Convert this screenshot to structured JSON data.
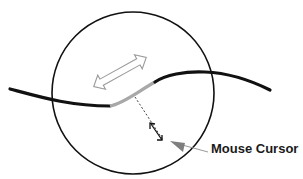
{
  "diagram": {
    "label": "Mouse Cursor",
    "colors": {
      "curve": "#111111",
      "highlight": "#a8a8a8",
      "circle": "#111111",
      "double_arrow_outline": "#9a9a9a",
      "cursor": "#7f7f7f",
      "leader_line": "#999999",
      "distance_line": "#333333"
    },
    "elements": {
      "circle": "selection radius circle",
      "curve": "path/curve being edited",
      "highlight_segment": "highlighted curve segment under cursor",
      "double_arrow": "hollow double-headed arrow indicating drag direction",
      "distance_indicator": "dashed line with arrowheads measuring cursor distance",
      "cursor": "mouse cursor triangle"
    }
  }
}
